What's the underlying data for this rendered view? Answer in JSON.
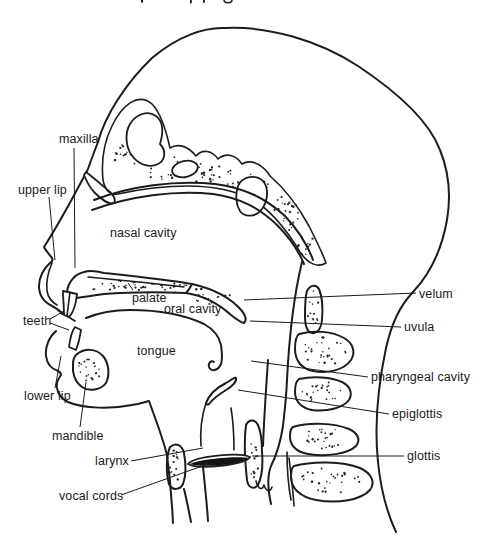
{
  "figure": {
    "ink_color": "#1c1c1c",
    "background_color": "#ffffff"
  },
  "labels": {
    "maxilla": "maxilla",
    "upper_lip": "upper lip",
    "teeth": "teeth",
    "lower_lip": "lower lip",
    "mandible": "mandible",
    "larynx": "larynx",
    "vocal_cords": "vocal cords",
    "nasal_cavity": "nasal cavity",
    "palate": "palate",
    "oral_cavity": "oral cavity",
    "tongue": "tongue",
    "velum": "velum",
    "uvula": "uvula",
    "pharyngeal_cavity": "pharyngeal cavity",
    "epiglottis": "epiglottis",
    "glottis": "glottis"
  }
}
